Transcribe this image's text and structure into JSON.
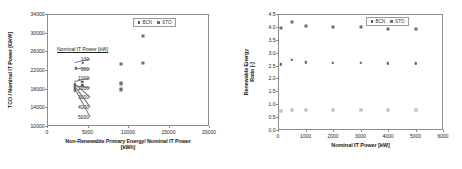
{
  "figure": {
    "panels": [
      "left",
      "right"
    ]
  },
  "chart_data": [
    {
      "type": "scatter",
      "panel": "left",
      "title": "",
      "xlabel": "Non-Renewable Primary Energy/ Nominal IT Power [kWh]",
      "xlabel_line1": "Non-Renewable Primary Energy/ Nominal IT Power",
      "xlabel_line2": "[kWh]",
      "ylabel": "TCO / Nominal IT Power  [€/kW]",
      "ylabel_line1": "TCO / Nominal IT Power  [€/kW]",
      "xlim": [
        0,
        20000
      ],
      "ylim": [
        10000,
        34000
      ],
      "xticks": [
        0,
        5000,
        10000,
        15000,
        20000
      ],
      "yticks": [
        10000,
        14000,
        18000,
        22000,
        26000,
        30000,
        34000
      ],
      "grid": false,
      "legend_position": "top-right",
      "legend": [
        "BCN",
        "STO"
      ],
      "annotation": {
        "title": "Nominal IT Power [kW]",
        "items": [
          "100",
          "500",
          "1000",
          "2000",
          "3000",
          "4000",
          "5000"
        ]
      },
      "series": [
        {
          "name": "BCN",
          "marker": "bcn",
          "points": [
            {
              "x": 4450,
              "y": 23600,
              "label": "100"
            },
            {
              "x": 3520,
              "y": 22400,
              "label": "500"
            },
            {
              "x": 4380,
              "y": 19500,
              "label": "1000"
            },
            {
              "x": 4380,
              "y": 18700,
              "label": "2000"
            },
            {
              "x": 3450,
              "y": 18900,
              "label": "3000"
            },
            {
              "x": 3450,
              "y": 18500,
              "label": "4000"
            },
            {
              "x": 3450,
              "y": 18100,
              "label": "5000"
            },
            {
              "x": 3430,
              "y": 17800,
              "label": ""
            },
            {
              "x": 3430,
              "y": 17500,
              "label": ""
            }
          ]
        },
        {
          "name": "STO",
          "marker": "sto",
          "points": [
            {
              "x": 11800,
              "y": 29200,
              "label": "100"
            },
            {
              "x": 11800,
              "y": 23400,
              "label": "500"
            },
            {
              "x": 9150,
              "y": 23300,
              "label": "1000"
            },
            {
              "x": 9150,
              "y": 19300,
              "label": "2000"
            },
            {
              "x": 9150,
              "y": 18900,
              "label": "3000"
            },
            {
              "x": 9150,
              "y": 17900,
              "label": "4000"
            },
            {
              "x": 9150,
              "y": 17700,
              "label": "5000"
            }
          ]
        }
      ]
    },
    {
      "type": "scatter",
      "panel": "right",
      "title": "",
      "xlabel": "Nominal IT Power [kW]",
      "ylabel": "Renewable Energy Ratio [-]",
      "ylabel_line1": "Renewable Energy",
      "ylabel_line2": "Ratio [-]",
      "xlim": [
        0,
        6000
      ],
      "ylim": [
        0.0,
        4.5
      ],
      "xticks": [
        0,
        1000,
        2000,
        3000,
        4000,
        5000,
        6000
      ],
      "yticks": [
        "0.0",
        "0.5",
        "1.0",
        "1.5",
        "2.0",
        "2.5",
        "3.0",
        "3.5",
        "4.0",
        "4.5"
      ],
      "ytick_values": [
        0.0,
        0.5,
        1.0,
        1.5,
        2.0,
        2.5,
        3.0,
        3.5,
        4.0,
        4.5
      ],
      "grid": false,
      "legend_position": "top-right",
      "legend": [
        "BCN",
        "STO"
      ],
      "series": [
        {
          "name": "STO",
          "marker": "sto",
          "points": [
            {
              "x": 100,
              "y": 3.95
            },
            {
              "x": 500,
              "y": 4.2
            },
            {
              "x": 1000,
              "y": 4.02
            },
            {
              "x": 2000,
              "y": 3.99
            },
            {
              "x": 3000,
              "y": 3.98
            },
            {
              "x": 4000,
              "y": 3.92
            },
            {
              "x": 5000,
              "y": 3.91
            }
          ]
        },
        {
          "name": "BCN",
          "marker": "bcn",
          "points": [
            {
              "x": 100,
              "y": 2.55
            },
            {
              "x": 500,
              "y": 2.72
            },
            {
              "x": 1000,
              "y": 2.62
            },
            {
              "x": 2000,
              "y": 2.61
            },
            {
              "x": 3000,
              "y": 2.61
            },
            {
              "x": 4000,
              "y": 2.59
            },
            {
              "x": 5000,
              "y": 2.58
            }
          ]
        },
        {
          "name": "low-band",
          "marker": "low",
          "points": [
            {
              "x": 100,
              "y": 0.74
            },
            {
              "x": 500,
              "y": 0.78
            },
            {
              "x": 1000,
              "y": 0.78
            },
            {
              "x": 2000,
              "y": 0.78
            },
            {
              "x": 3000,
              "y": 0.78
            },
            {
              "x": 4000,
              "y": 0.78
            },
            {
              "x": 5000,
              "y": 0.79
            }
          ]
        }
      ]
    }
  ]
}
